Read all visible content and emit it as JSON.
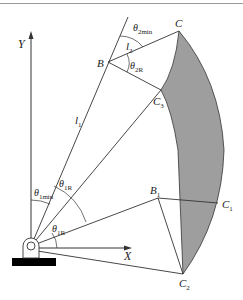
{
  "figure": {
    "axes": {
      "x_label": "X",
      "y_label": "Y"
    },
    "points": {
      "B": "B",
      "C": "C",
      "C3": {
        "base": "C",
        "sub": "3"
      },
      "B1": {
        "base": "B",
        "sub": "1"
      },
      "C1": {
        "base": "C",
        "sub": "1"
      },
      "C2": {
        "base": "C",
        "sub": "2"
      }
    },
    "links": {
      "l1": {
        "base": "l",
        "sub": "1"
      },
      "l2": {
        "base": "l",
        "sub": "2"
      }
    },
    "angles": {
      "theta2min": {
        "base": "θ",
        "sub": "2min"
      },
      "theta2R": {
        "base": "θ",
        "sub": "2R"
      },
      "theta1min": {
        "base": "θ",
        "sub": "1min"
      },
      "theta1R_upper": {
        "base": "θ",
        "sub": "1R"
      },
      "theta1R_lower": {
        "base": "θ",
        "sub": "1R"
      }
    },
    "colors": {
      "line": "#333333",
      "shade": "#9e9e9e",
      "base": "#000000"
    }
  }
}
